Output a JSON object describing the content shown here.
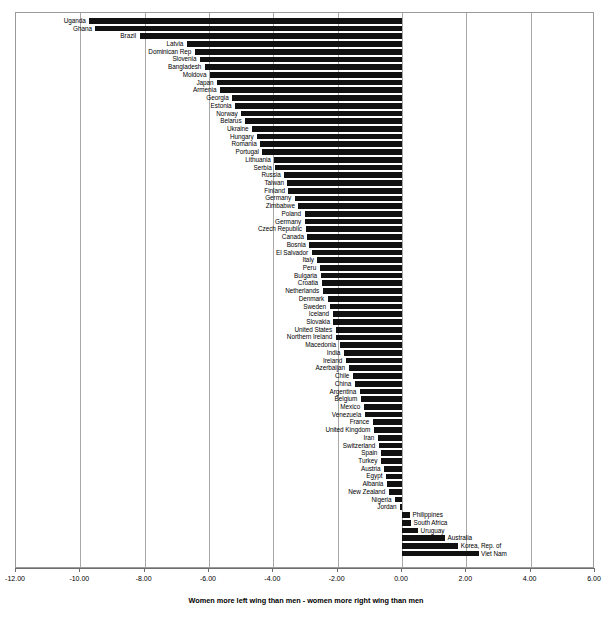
{
  "chart_data": {
    "type": "bar",
    "orientation": "horizontal",
    "title": "",
    "subtitle": "",
    "xlabel": "Women more left wing than men - women more right wing than men",
    "ylabel": "",
    "xlim": [
      -12.0,
      6.0
    ],
    "xticks": [
      "-12.00",
      "-10.00",
      "-8.00",
      "-6.00",
      "-4.00",
      "-2.00",
      "0.00",
      "2.00",
      "4.00",
      "6.00"
    ],
    "xtick_values": [
      -12,
      -10,
      -8,
      -6,
      -4,
      -2,
      0,
      2,
      4,
      6
    ],
    "grid": true,
    "grid_axis": "x",
    "legend": "none",
    "bar_color": "#111111",
    "categories": [
      "Uganda",
      "Ghana",
      "Brazil",
      "Latvia",
      "Dominican Rep",
      "Slovenia",
      "Bangladesh",
      "Moldova",
      "Japan",
      "Armenia",
      "Georgia",
      "Estonia",
      "Norway",
      "Belarus",
      "Ukraine",
      "Hungary",
      "Romania",
      "Portugal",
      "Lithuania",
      "Serbia",
      "Russia",
      "Taiwan",
      "Finland",
      "Germany",
      "Zimbabwe",
      "Poland",
      "Germany",
      "Czech Republic",
      "Canada",
      "Bosnia",
      "El Salvador",
      "Italy",
      "Peru",
      "Bulgaria",
      "Croatia",
      "Netherlands",
      "Denmark",
      "Sweden",
      "Iceland",
      "Slovakia",
      "United States",
      "Northern Ireland",
      "Macedonia",
      "India",
      "Ireland",
      "Azerbaijan",
      "Chile",
      "China",
      "Argentina",
      "Belgium",
      "Mexico",
      "Venezuela",
      "France",
      "United Kingdom",
      "Iran",
      "Switzerland",
      "Spain",
      "Turkey",
      "Austria",
      "Egypt",
      "Albania",
      "New Zealand",
      "Nigeria",
      "Jordan",
      "Philippines",
      "South Africa",
      "Uruguay",
      "Australia",
      "Korea, Rep. of",
      "Viet Nam"
    ],
    "values": [
      -9.72,
      -9.53,
      -8.16,
      -6.69,
      -6.44,
      -6.28,
      -6.13,
      -5.97,
      -5.75,
      -5.66,
      -5.28,
      -5.19,
      -5.0,
      -4.88,
      -4.66,
      -4.5,
      -4.41,
      -4.34,
      -3.97,
      -3.94,
      -3.66,
      -3.56,
      -3.53,
      -3.34,
      -3.22,
      -3.03,
      -3.03,
      -3.0,
      -2.94,
      -2.88,
      -2.81,
      -2.63,
      -2.56,
      -2.53,
      -2.5,
      -2.47,
      -2.31,
      -2.25,
      -2.16,
      -2.13,
      -2.06,
      -2.06,
      -1.94,
      -1.81,
      -1.75,
      -1.66,
      -1.53,
      -1.47,
      -1.31,
      -1.28,
      -1.19,
      -1.16,
      -0.91,
      -0.88,
      -0.75,
      -0.72,
      -0.66,
      -0.66,
      -0.56,
      -0.5,
      -0.47,
      -0.41,
      -0.22,
      -0.06,
      0.25,
      0.28,
      0.5,
      1.34,
      1.75,
      2.38
    ]
  }
}
